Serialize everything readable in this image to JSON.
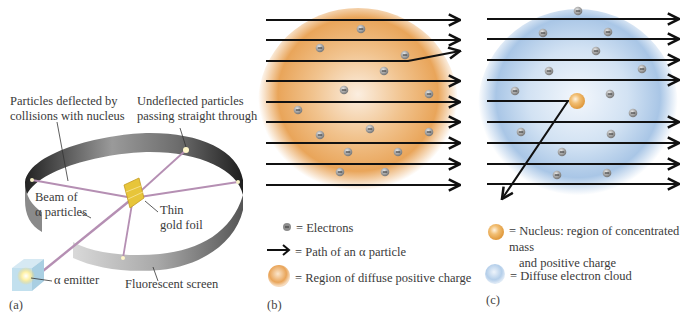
{
  "panel_a": {
    "tag": "(a)",
    "labels": {
      "deflected_line1": "Particles deflected by",
      "deflected_line2": "collisions with nucleus",
      "undeflected_line1": "Undeflected particles",
      "undeflected_line2": "passing straight through",
      "beam_line1": "Beam of",
      "beam_line2": "α particles",
      "foil_line1": "Thin",
      "foil_line2": "gold foil",
      "emitter": "α emitter",
      "screen": "Fluorescent screen"
    }
  },
  "panel_b": {
    "tag": "(b)",
    "legend": [
      {
        "icon": "electron-icon",
        "text": "= Electrons"
      },
      {
        "icon": "arrow-icon",
        "text": "= Path of an α particle"
      },
      {
        "icon": "positive-charge-sphere-icon",
        "text": "= Region of diffuse positive charge"
      }
    ]
  },
  "panel_c": {
    "tag": "(c)",
    "legend": [
      {
        "icon": "nucleus-icon",
        "text_line1": "= Nucleus: region of concentrated mass",
        "text_line2": "and positive charge"
      },
      {
        "icon": "electron-cloud-icon",
        "text": "= Diffuse electron cloud"
      }
    ]
  },
  "colors": {
    "positive_charge": "#e9a55a",
    "electron_cloud": "#a9c6e6",
    "nucleus": "#e8a84e",
    "gold_foil": "#e7c53a",
    "beam": "#b58fb3",
    "screen_dark": "#3a3a3a",
    "screen_light": "#bdbdbd"
  }
}
